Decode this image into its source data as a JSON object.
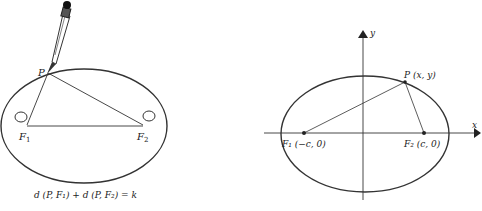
{
  "left_figure": {
    "point_label": "P",
    "focus1_label": "F",
    "focus1_sub": "1",
    "focus2_label": "F",
    "focus2_sub": "2",
    "equation": "d (P, F₁) + d (P, F₂) = k"
  },
  "right_figure": {
    "x_axis_label": "x",
    "y_axis_label": "y",
    "point_label": "P (x, y)",
    "focus1_label": "F₁ (−c, 0)",
    "focus2_label": "F₂ (c, 0)"
  },
  "colors": {
    "ink": "#222222",
    "background": "#ffffff"
  }
}
